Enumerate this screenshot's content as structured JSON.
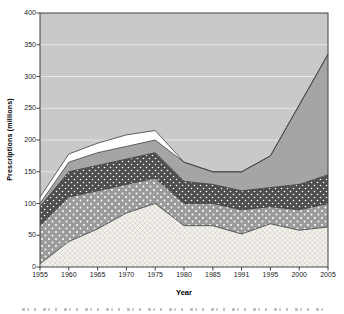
{
  "figure": {
    "y_axis_title": "Prescriptions (millions)",
    "x_axis_title": "Year"
  },
  "chart_data": {
    "type": "area",
    "stacked": true,
    "title": "",
    "xlabel": "Year",
    "ylabel": "Prescriptions (millions)",
    "categories": [
      "1955",
      "1960",
      "1965",
      "1970",
      "1975",
      "1980",
      "1985",
      "1991",
      "1995",
      "2000",
      "2005"
    ],
    "y_ticks": [
      0,
      50,
      100,
      150,
      200,
      250,
      300,
      350,
      400
    ],
    "ylim": [
      0,
      400
    ],
    "grid": "horizontal-only",
    "legend": "none",
    "series": [
      {
        "name": "band-1-light-crosshatch",
        "pattern": "light-crosshatch",
        "values": [
          5,
          40,
          60,
          85,
          100,
          65,
          65,
          52,
          68,
          58,
          63
        ]
      },
      {
        "name": "band-2-gray-polka-dot",
        "pattern": "gray-polka-dot",
        "values": [
          60,
          70,
          60,
          45,
          40,
          35,
          35,
          38,
          27,
          32,
          37
        ]
      },
      {
        "name": "band-3-dark-dotted",
        "pattern": "dark-dotted",
        "values": [
          30,
          40,
          40,
          40,
          40,
          35,
          30,
          30,
          30,
          40,
          45
        ]
      },
      {
        "name": "band-4-solid-gray",
        "pattern": "solid-gray",
        "values": [
          5,
          15,
          20,
          20,
          20,
          30,
          20,
          30,
          50,
          125,
          190
        ]
      },
      {
        "name": "band-5-white",
        "pattern": "solid-white",
        "values": [
          10,
          13,
          15,
          18,
          15,
          0,
          0,
          0,
          0,
          0,
          0
        ]
      }
    ],
    "cumulative_totals": [
      110,
      178,
      195,
      208,
      215,
      165,
      150,
      150,
      175,
      255,
      335
    ],
    "colors": {
      "plot_background": "#c9c9c9",
      "gridline": "#e6e6e6",
      "axis_line": "#424242",
      "series_outline": "#3d3d3d",
      "solid_gray_area": "#a5a5a5",
      "polka_dot_background": "#9b9b9b",
      "dark_dot_background": "#4e4e4e",
      "hatch_background": "#f2f1ec",
      "hatch_line": "#cfcdc5",
      "dot_color": "#ffffff",
      "white_area": "#ffffff",
      "tick_text": "#1a1a1a"
    }
  }
}
